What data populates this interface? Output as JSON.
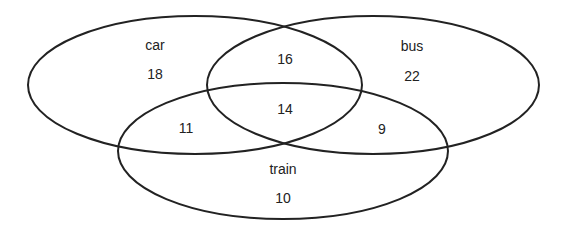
{
  "diagram": {
    "type": "venn",
    "sets": [
      {
        "id": "car",
        "label": "car",
        "cx": 195,
        "cy": 85,
        "rx": 167,
        "ry": 69
      },
      {
        "id": "bus",
        "label": "bus",
        "cx": 373,
        "cy": 85,
        "rx": 166,
        "ry": 69
      },
      {
        "id": "train",
        "label": "train",
        "cx": 283,
        "cy": 151,
        "rx": 165,
        "ry": 68
      }
    ],
    "regions": {
      "car_only": "18",
      "bus_only": "22",
      "train_only": "10",
      "car_bus_only": "16",
      "car_train_only": "11",
      "bus_train_only": "9",
      "all_three": "14"
    },
    "stroke_color": "#222222",
    "background": "#ffffff"
  }
}
